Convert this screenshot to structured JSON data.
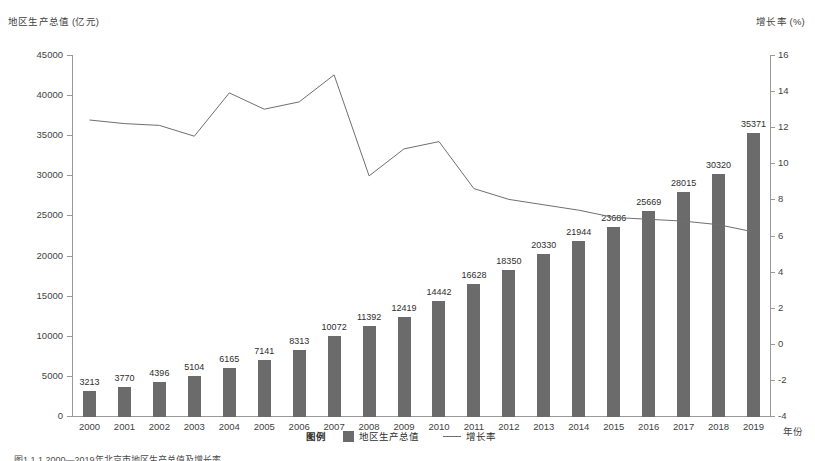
{
  "axes": {
    "left_title": "地区生产总值 (亿元)",
    "right_title": "增长率 (%)",
    "x_axis_name": "年份",
    "left_ticks": [
      "45000",
      "40000",
      "35000",
      "30000",
      "25000",
      "20000",
      "15000",
      "10000",
      "5000",
      "0"
    ],
    "right_ticks": [
      "16",
      "14",
      "12",
      "10",
      "8",
      "6",
      "4",
      "2",
      "0",
      "-2",
      "-4"
    ]
  },
  "legend": {
    "title": "图例",
    "bar_label": "地区生产总值",
    "line_label": "增长率"
  },
  "colors": {
    "bar": "#6b6b6b",
    "line": "#6f6f6f",
    "axis": "#9a9a9a",
    "text": "#3f3f3f"
  },
  "caption": "图1.1.1  2000—2019年北京市地区生产总值及增长率",
  "chart_data": {
    "type": "bar",
    "title": "",
    "xlabel": "年份",
    "ylabel": "地区生产总值 (亿元)",
    "ylim": [
      0,
      45000
    ],
    "y2label": "增长率 (%)",
    "y2lim": [
      -4,
      16
    ],
    "grid": false,
    "legend_position": "bottom",
    "categories": [
      "2000",
      "2001",
      "2002",
      "2003",
      "2004",
      "2005",
      "2006",
      "2007",
      "2008",
      "2009",
      "2010",
      "2011",
      "2012",
      "2013",
      "2014",
      "2015",
      "2016",
      "2017",
      "2018",
      "2019"
    ],
    "series": [
      {
        "name": "地区生产总值",
        "type": "bar",
        "axis": "left",
        "unit": "亿元",
        "values": [
          3213,
          3770,
          4396,
          5104,
          6165,
          7141,
          8313,
          10072,
          11392,
          12419,
          14442,
          16628,
          18350,
          20330,
          21944,
          23686,
          25669,
          28015,
          30320,
          35371
        ],
        "labels": [
          "3213",
          "3770",
          "4396",
          "5104",
          "6165",
          "7141",
          "8313",
          "10072",
          "11392",
          "12419",
          "14442",
          "16628",
          "18350",
          "20330",
          "21944",
          "23686",
          "25669",
          "28015",
          "30320",
          "35371"
        ]
      },
      {
        "name": "增长率",
        "type": "line",
        "axis": "right",
        "unit": "%",
        "values": [
          12.4,
          12.2,
          12.1,
          11.5,
          13.9,
          13.0,
          13.4,
          14.9,
          9.3,
          10.8,
          11.2,
          8.6,
          8.0,
          7.7,
          7.4,
          7.0,
          6.9,
          6.8,
          6.6,
          6.2
        ]
      }
    ]
  }
}
